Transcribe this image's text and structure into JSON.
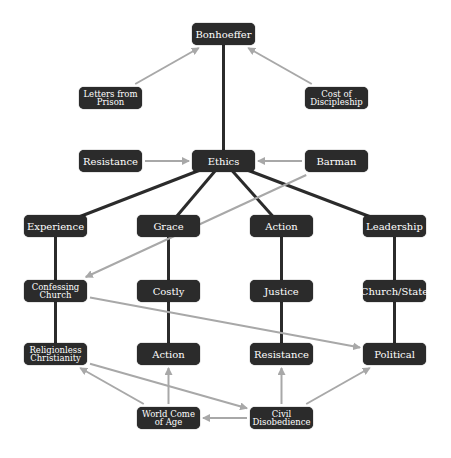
{
  "diagram": {
    "title": "Bonhoeffer",
    "colors": {
      "node_fill": "#2b2b2b",
      "node_text": "#ffffff",
      "strong_edge": "#2b2b2b",
      "weak_edge": "#a8a8a8",
      "background": "#ffffff"
    },
    "nodes": [
      {
        "id": "bonhoeffer",
        "label": "Bonhoeffer",
        "x": 192,
        "y": 23,
        "w": 63,
        "h": 22
      },
      {
        "id": "letters",
        "label": "Letters from Prison",
        "x": 79,
        "y": 87,
        "w": 63,
        "h": 22,
        "small": true
      },
      {
        "id": "cost",
        "label": "Cost of Discipleship",
        "x": 305,
        "y": 87,
        "w": 63,
        "h": 22,
        "small": true
      },
      {
        "id": "resistance_top",
        "label": "Resistance",
        "x": 79,
        "y": 150,
        "w": 63,
        "h": 22
      },
      {
        "id": "ethics",
        "label": "Ethics",
        "x": 192,
        "y": 150,
        "w": 63,
        "h": 22
      },
      {
        "id": "barman",
        "label": "Barman",
        "x": 305,
        "y": 150,
        "w": 63,
        "h": 22
      },
      {
        "id": "experience",
        "label": "Experience",
        "x": 24,
        "y": 215,
        "w": 63,
        "h": 22
      },
      {
        "id": "grace",
        "label": "Grace",
        "x": 137,
        "y": 215,
        "w": 63,
        "h": 22
      },
      {
        "id": "action_top",
        "label": "Action",
        "x": 250,
        "y": 215,
        "w": 63,
        "h": 22
      },
      {
        "id": "leadership",
        "label": "Leadership",
        "x": 363,
        "y": 215,
        "w": 63,
        "h": 22
      },
      {
        "id": "confessing",
        "label": "Confessing Church",
        "x": 24,
        "y": 280,
        "w": 63,
        "h": 22,
        "small": true
      },
      {
        "id": "costly",
        "label": "Costly",
        "x": 137,
        "y": 280,
        "w": 63,
        "h": 22
      },
      {
        "id": "justice",
        "label": "Justice",
        "x": 250,
        "y": 280,
        "w": 63,
        "h": 22
      },
      {
        "id": "churchstate",
        "label": "Church/State",
        "x": 363,
        "y": 280,
        "w": 63,
        "h": 22
      },
      {
        "id": "religionless",
        "label": "Religionless Christianity",
        "x": 24,
        "y": 343,
        "w": 63,
        "h": 22,
        "small": true
      },
      {
        "id": "action_bottom",
        "label": "Action",
        "x": 137,
        "y": 343,
        "w": 63,
        "h": 22
      },
      {
        "id": "resistance_bottom",
        "label": "Resistance",
        "x": 250,
        "y": 343,
        "w": 63,
        "h": 22
      },
      {
        "id": "political",
        "label": "Political",
        "x": 363,
        "y": 343,
        "w": 63,
        "h": 22
      },
      {
        "id": "worldcome",
        "label": "World Come of Age",
        "x": 137,
        "y": 407,
        "w": 63,
        "h": 22,
        "small": true
      },
      {
        "id": "civil",
        "label": "Civil Disobedience",
        "x": 250,
        "y": 407,
        "w": 63,
        "h": 22,
        "small": true
      }
    ],
    "strong_edges": [
      [
        "bonhoeffer",
        "ethics"
      ],
      [
        "ethics",
        "experience"
      ],
      [
        "ethics",
        "grace"
      ],
      [
        "ethics",
        "action_top"
      ],
      [
        "ethics",
        "leadership"
      ],
      [
        "experience",
        "confessing"
      ],
      [
        "grace",
        "costly"
      ],
      [
        "action_top",
        "justice"
      ],
      [
        "leadership",
        "churchstate"
      ],
      [
        "confessing",
        "religionless"
      ],
      [
        "costly",
        "action_bottom"
      ],
      [
        "justice",
        "resistance_bottom"
      ],
      [
        "churchstate",
        "political"
      ]
    ],
    "arrow_edges": [
      {
        "from": "letters",
        "to": "bonhoeffer"
      },
      {
        "from": "cost",
        "to": "bonhoeffer"
      },
      {
        "from": "resistance_top",
        "to": "ethics"
      },
      {
        "from": "barman",
        "to": "ethics"
      },
      {
        "from": "barman",
        "to": "confessing"
      },
      {
        "from": "confessing",
        "to": "political"
      },
      {
        "from": "religionless",
        "to": "civil"
      },
      {
        "from": "worldcome",
        "to": "religionless"
      },
      {
        "from": "worldcome",
        "to": "action_bottom"
      },
      {
        "from": "civil",
        "to": "worldcome"
      },
      {
        "from": "civil",
        "to": "resistance_bottom"
      },
      {
        "from": "civil",
        "to": "political"
      }
    ]
  }
}
